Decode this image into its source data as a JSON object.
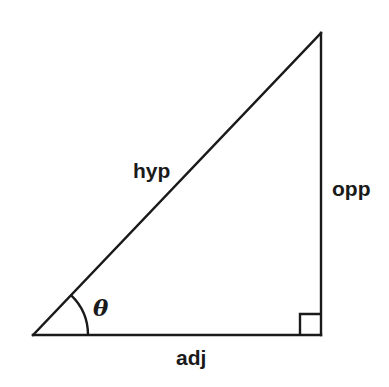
{
  "figure": {
    "type": "right-triangle-trigonometry-diagram",
    "background_color": "#ffffff",
    "stroke_color": "#1a1a1a",
    "stroke_width": 2.4,
    "width": 389,
    "height": 387
  },
  "geometry": {
    "vertices": {
      "left": {
        "x": 33,
        "y": 335
      },
      "bottom_right": {
        "x": 321,
        "y": 335
      },
      "top_right": {
        "x": 321,
        "y": 33
      }
    },
    "angle_arc": {
      "center_x": 33,
      "center_y": 335,
      "radius": 55,
      "start_x": 88,
      "start_y": 335,
      "end_x": 71,
      "end_y": 292
    },
    "right_angle_marker": {
      "x": 300,
      "y": 314,
      "size": 21
    }
  },
  "labels": {
    "hypotenuse": "hyp",
    "opposite": "opp",
    "adjacent": "adj",
    "angle": "θ"
  }
}
